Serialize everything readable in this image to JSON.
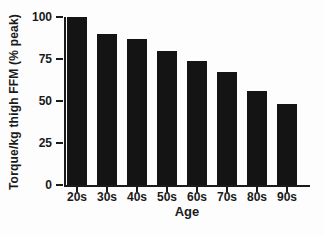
{
  "figure": {
    "background": "#fdfdfd"
  },
  "chart_data": {
    "type": "bar",
    "title": "",
    "xlabel": "Age",
    "ylabel": "Torque/kg thigh FFM (% peak)",
    "categories": [
      "20s",
      "30s",
      "40s",
      "50s",
      "60s",
      "70s",
      "80s",
      "90s"
    ],
    "values": [
      100,
      90,
      87,
      80,
      74,
      67,
      56,
      48
    ],
    "ylim": [
      0,
      100
    ],
    "yticks": [
      0,
      25,
      50,
      75,
      100
    ],
    "grid": false,
    "legend": "none",
    "bar_color": "#141414",
    "axis_color": "#1a1a1a",
    "text_color": "#1a1a1a"
  }
}
